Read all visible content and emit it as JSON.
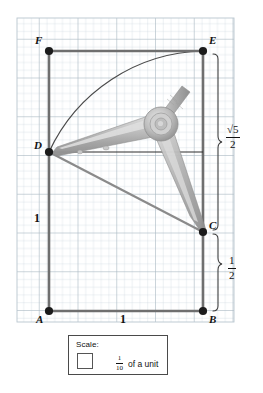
{
  "figure": {
    "grid": {
      "x0": 17,
      "y0": 18,
      "x1": 234,
      "y1": 322,
      "cell": 7.75,
      "minor_color": "#c9d4dc",
      "major_color": "#a8b6c0",
      "major_every": 5,
      "background": "#ffffff"
    },
    "points": [
      {
        "id": "F",
        "label": "F",
        "x": 49,
        "y": 51,
        "label_dx": -11,
        "label_dy": -13
      },
      {
        "id": "E",
        "label": "E",
        "x": 203,
        "y": 51,
        "label_dx": 6,
        "label_dy": -13
      },
      {
        "id": "D",
        "label": "D",
        "x": 49,
        "y": 152,
        "label_dx": -13,
        "label_dy": -11
      },
      {
        "id": "C",
        "label": "C",
        "x": 203,
        "y": 232,
        "label_dx": 6,
        "label_dy": -11
      },
      {
        "id": "A",
        "label": "A",
        "x": 49,
        "y": 311,
        "label_dx": -12,
        "label_dy": 4
      },
      {
        "id": "B",
        "label": "B",
        "x": 203,
        "y": 311,
        "label_dx": 6,
        "label_dy": 4
      }
    ],
    "segments": [
      {
        "name": "segment-FE",
        "x1": 49,
        "y1": 51,
        "x2": 203,
        "y2": 51,
        "color": "#6f6f6f",
        "width": 2.6
      },
      {
        "name": "segment-FA",
        "x1": 49,
        "y1": 51,
        "x2": 49,
        "y2": 311,
        "color": "#6f6f6f",
        "width": 2.6
      },
      {
        "name": "segment-EB",
        "x1": 203,
        "y1": 51,
        "x2": 203,
        "y2": 311,
        "color": "#6f6f6f",
        "width": 2.6
      },
      {
        "name": "segment-AB",
        "x1": 49,
        "y1": 311,
        "x2": 203,
        "y2": 311,
        "color": "#6f6f6f",
        "width": 2.6
      },
      {
        "name": "segment-DC",
        "x1": 49,
        "y1": 152,
        "x2": 203,
        "y2": 232,
        "color": "#8a8a8a",
        "width": 2.2
      },
      {
        "name": "segment-D-horizontal",
        "x1": 49,
        "y1": 152,
        "x2": 203,
        "y2": 152,
        "color": "#2e2e2e",
        "width": 1.2
      }
    ],
    "arc": {
      "name": "arc-D-to-E",
      "from_x": 49,
      "from_y": 152,
      "to_x": 203,
      "to_y": 51,
      "center_x": 203,
      "center_y": 232,
      "radius": 174,
      "color": "#4b4b4b",
      "width": 1.2
    },
    "measures": [
      {
        "name": "measure-sqrt5-over-2",
        "brace_x": 219,
        "brace_top": 54,
        "brace_bottom": 230,
        "label_x": 228,
        "label_y": 133,
        "numerator": "√5",
        "denominator": "2"
      },
      {
        "name": "measure-one-half",
        "brace_x": 219,
        "brace_top": 234,
        "brace_bottom": 311,
        "label_x": 229,
        "label_y": 264,
        "numerator": "1",
        "denominator": "2"
      }
    ],
    "edge_labels": [
      {
        "name": "label-side-AD",
        "text": "1",
        "x": 36,
        "y": 213
      },
      {
        "name": "label-side-AB",
        "text": "1",
        "x": 123,
        "y": 316
      }
    ],
    "compass": {
      "name": "compass-tool",
      "pivot_x": 160,
      "pivot_y": 124,
      "tip_left_x": 52,
      "tip_left_y": 153,
      "tip_right_x": 202,
      "tip_right_y": 231,
      "handle_tip_x": 178,
      "handle_tip_y": 93,
      "body_color": "#b7b7b7",
      "shade_color": "#9a9a9a",
      "light_color": "#d8d8d8"
    }
  },
  "scale_legend": {
    "name": "scale-legend",
    "title": "Scale:",
    "numerator": "1",
    "denominator": "10",
    "unit_text": "of a unit",
    "arrow_icon": "left-arrow-icon",
    "border_color": "#4a4a4a"
  }
}
